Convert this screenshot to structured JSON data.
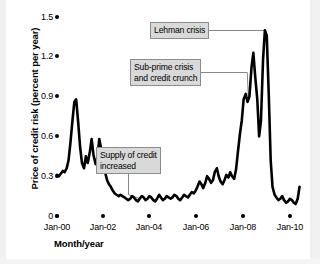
{
  "chart_data": {
    "type": "line",
    "title": "",
    "xlabel": "Month/year",
    "ylabel": "Price of credit risk (percent per year)",
    "xlim": [
      2000.0,
      2010.6
    ],
    "ylim": [
      0,
      1.5
    ],
    "grid": false,
    "legend": null,
    "x_tick_labels": [
      "Jan-00",
      "Jan-02",
      "Jan-04",
      "Jan-06",
      "Jan-08",
      "Jan-10"
    ],
    "x_tick_values": [
      2000,
      2002,
      2004,
      2006,
      2008,
      2010
    ],
    "y_tick_labels": [
      "0",
      "0.3",
      "0.6",
      "0.9",
      "1.2",
      "1.5"
    ],
    "y_tick_values": [
      0,
      0.3,
      0.6,
      0.9,
      1.2,
      1.5
    ],
    "series": [
      {
        "name": "Price of credit risk",
        "x": [
          2000.0,
          2000.08,
          2000.17,
          2000.25,
          2000.33,
          2000.42,
          2000.5,
          2000.58,
          2000.67,
          2000.75,
          2000.83,
          2000.92,
          2001.0,
          2001.08,
          2001.17,
          2001.25,
          2001.33,
          2001.42,
          2001.5,
          2001.58,
          2001.67,
          2001.75,
          2001.83,
          2001.92,
          2002.0,
          2002.08,
          2002.17,
          2002.25,
          2002.33,
          2002.42,
          2002.5,
          2002.58,
          2002.67,
          2002.75,
          2002.83,
          2002.92,
          2003.0,
          2003.08,
          2003.17,
          2003.25,
          2003.33,
          2003.42,
          2003.5,
          2003.58,
          2003.67,
          2003.75,
          2003.83,
          2003.92,
          2004.0,
          2004.08,
          2004.17,
          2004.25,
          2004.33,
          2004.42,
          2004.5,
          2004.58,
          2004.67,
          2004.75,
          2004.83,
          2004.92,
          2005.0,
          2005.08,
          2005.17,
          2005.25,
          2005.33,
          2005.42,
          2005.5,
          2005.58,
          2005.67,
          2005.75,
          2005.83,
          2005.92,
          2006.0,
          2006.08,
          2006.17,
          2006.25,
          2006.33,
          2006.42,
          2006.5,
          2006.58,
          2006.67,
          2006.75,
          2006.83,
          2006.92,
          2007.0,
          2007.08,
          2007.17,
          2007.25,
          2007.33,
          2007.42,
          2007.5,
          2007.58,
          2007.67,
          2007.75,
          2007.83,
          2007.92,
          2008.0,
          2008.08,
          2008.17,
          2008.25,
          2008.33,
          2008.42,
          2008.5,
          2008.58,
          2008.67,
          2008.75,
          2008.83,
          2008.92,
          2009.0,
          2009.08,
          2009.17,
          2009.25,
          2009.33,
          2009.42,
          2009.5,
          2009.58,
          2009.67,
          2009.75,
          2009.83,
          2009.92,
          2010.0,
          2010.08,
          2010.17,
          2010.25,
          2010.33,
          2010.42,
          2010.5
        ],
        "y": [
          0.31,
          0.3,
          0.32,
          0.34,
          0.33,
          0.36,
          0.42,
          0.55,
          0.72,
          0.86,
          0.88,
          0.7,
          0.52,
          0.4,
          0.36,
          0.45,
          0.4,
          0.48,
          0.58,
          0.46,
          0.39,
          0.44,
          0.58,
          0.5,
          0.42,
          0.33,
          0.27,
          0.24,
          0.22,
          0.19,
          0.17,
          0.16,
          0.15,
          0.16,
          0.15,
          0.14,
          0.13,
          0.12,
          0.13,
          0.15,
          0.14,
          0.12,
          0.11,
          0.13,
          0.15,
          0.14,
          0.12,
          0.13,
          0.15,
          0.14,
          0.12,
          0.11,
          0.13,
          0.16,
          0.14,
          0.12,
          0.13,
          0.15,
          0.14,
          0.13,
          0.14,
          0.16,
          0.15,
          0.13,
          0.12,
          0.14,
          0.16,
          0.15,
          0.14,
          0.16,
          0.18,
          0.17,
          0.19,
          0.22,
          0.26,
          0.24,
          0.21,
          0.25,
          0.3,
          0.28,
          0.25,
          0.27,
          0.33,
          0.36,
          0.3,
          0.26,
          0.24,
          0.27,
          0.31,
          0.29,
          0.33,
          0.3,
          0.28,
          0.35,
          0.48,
          0.62,
          0.72,
          0.88,
          0.92,
          0.86,
          0.9,
          1.12,
          1.23,
          1.05,
          0.88,
          0.6,
          0.72,
          1.18,
          1.4,
          1.36,
          0.9,
          0.42,
          0.22,
          0.16,
          0.14,
          0.12,
          0.13,
          0.15,
          0.12,
          0.1,
          0.11,
          0.13,
          0.12,
          0.1,
          0.09,
          0.13,
          0.22
        ]
      }
    ],
    "annotations": [
      {
        "id": "lehman",
        "text": "Lehman crisis",
        "target_x": 2009.02,
        "target_y": 1.4
      },
      {
        "id": "subprime",
        "text": "Sub-prime crisis\nand credit crunch",
        "target_x": 2008.28,
        "target_y": 0.9
      },
      {
        "id": "supply",
        "text": "Supply of credit\nincreased",
        "target_x": 2003.6,
        "target_y": 0.13
      }
    ]
  },
  "axes": {
    "ylabel": "Price of credit risk (percent per year)",
    "xlabel": "Month/year",
    "y_ticks": [
      {
        "label": "1.5",
        "value": 1.5
      },
      {
        "label": "1.2",
        "value": 1.2
      },
      {
        "label": "0.9",
        "value": 0.9
      },
      {
        "label": "0.6",
        "value": 0.6
      },
      {
        "label": "0.3",
        "value": 0.3
      },
      {
        "label": "0",
        "value": 0
      }
    ],
    "x_ticks": [
      {
        "label": "Jan-00",
        "value": 2000
      },
      {
        "label": "Jan-02",
        "value": 2002
      },
      {
        "label": "Jan-04",
        "value": 2004
      },
      {
        "label": "Jan-06",
        "value": 2006
      },
      {
        "label": "Jan-08",
        "value": 2008
      },
      {
        "label": "Jan-10",
        "value": 2010
      }
    ]
  },
  "annotations": {
    "lehman": "Lehman crisis",
    "subprime_line1": "Sub-prime crisis",
    "subprime_line2": "and credit crunch",
    "supply_line1": "Supply of credit",
    "supply_line2": "increased"
  },
  "colors": {
    "series": "#000000",
    "annotation_fill": "#d9d9d9",
    "annotation_border": "#8c8c8c",
    "background": "#ffffff",
    "text": "#000000"
  }
}
